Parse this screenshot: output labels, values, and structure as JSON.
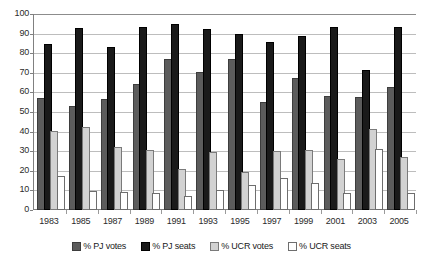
{
  "chart_data": {
    "type": "bar",
    "title": "",
    "subtitle": "",
    "xlabel": "",
    "ylabel": "",
    "ylim": [
      0,
      100
    ],
    "ytick_step": 10,
    "yticks": [
      0,
      10,
      20,
      30,
      40,
      50,
      60,
      70,
      80,
      90,
      100
    ],
    "grid": "horizontal",
    "legend_position": "bottom",
    "categories": [
      "1983",
      "1985",
      "1987",
      "1989",
      "1991",
      "1993",
      "1995",
      "1997",
      "1999",
      "2001",
      "2003",
      "2005"
    ],
    "series": [
      {
        "name": "% PJ votes",
        "color": "#5c5c5c",
        "values": [
          56.2,
          52.0,
          55.7,
          63.3,
          76.1,
          69.2,
          76.1,
          53.9,
          66.4,
          56.9,
          56.7,
          61.5
        ]
      },
      {
        "name": "% PJ seats",
        "color": "#1a1a1a",
        "values": [
          83.9,
          91.7,
          82.0,
          92.3,
          94.0,
          91.2,
          88.6,
          84.7,
          87.8,
          92.3,
          70.2,
          92.3
        ]
      },
      {
        "name": "% UCR votes",
        "color": "#d2d2d2",
        "values": [
          39.5,
          41.4,
          31.1,
          29.4,
          19.7,
          28.5,
          18.5,
          29.2,
          29.8,
          25.1,
          40.2,
          26.0
        ]
      },
      {
        "name": "% UCR seats",
        "color": "#ffffff",
        "values": [
          16.1,
          8.7,
          8.1,
          7.8,
          6.1,
          9.1,
          11.8,
          15.5,
          12.6,
          7.9,
          30.3,
          7.8
        ]
      }
    ]
  },
  "legend": {
    "items": [
      {
        "label": "% PJ votes",
        "swatch": "pj-votes"
      },
      {
        "label": "% PJ seats",
        "swatch": "pj-seats"
      },
      {
        "label": "% UCR votes",
        "swatch": "ucr-votes"
      },
      {
        "label": "% UCR seats",
        "swatch": "ucr-seats"
      }
    ]
  }
}
